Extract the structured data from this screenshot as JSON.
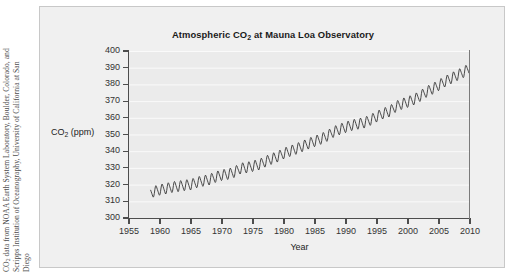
{
  "figure": {
    "background_color": "#ffffff",
    "panel_color": "#f0f0f0",
    "plot_color": "#ebebeb",
    "gridline_color": "#fafafa",
    "line_color": "#2b2b2b"
  },
  "credit": {
    "line1": "CO",
    "line1_sub": "2",
    "line1_rest": " data from NOAA Earth System Laboratory, Boulder, Colorado, and",
    "line2": "Scripps Institution of Oceanography, University of California at San",
    "line3": "Diego"
  },
  "chart_data": {
    "type": "line",
    "title": "Atmospheric CO",
    "title_sub": "2",
    "title_rest": " at Mauna Loa Observatory",
    "xlabel": "Year",
    "ylabel": "CO",
    "ylabel_sub": "2",
    "ylabel_rest": " (ppm)",
    "xlim": [
      1955,
      2010
    ],
    "ylim": [
      300,
      400
    ],
    "xticks": [
      1955,
      1960,
      1965,
      1970,
      1975,
      1980,
      1985,
      1990,
      1995,
      2000,
      2005,
      2010
    ],
    "yticks": [
      300,
      310,
      320,
      330,
      340,
      350,
      360,
      370,
      380,
      390,
      400
    ],
    "grid": "horizontal",
    "legend": "none",
    "seasonal_amplitude_ppm": 3.0,
    "series": [
      {
        "name": "Mauna Loa monthly mean CO2",
        "description": "Keeling Curve: annual-mean trend with seasonal sawtooth oscillation",
        "x": [
          1958.5,
          1959,
          1960,
          1961,
          1962,
          1963,
          1964,
          1965,
          1966,
          1967,
          1968,
          1969,
          1970,
          1971,
          1972,
          1973,
          1974,
          1975,
          1976,
          1977,
          1978,
          1979,
          1980,
          1981,
          1982,
          1983,
          1984,
          1985,
          1986,
          1987,
          1988,
          1989,
          1990,
          1991,
          1992,
          1993,
          1994,
          1995,
          1996,
          1997,
          1998,
          1999,
          2000,
          2001,
          2002,
          2003,
          2004,
          2005,
          2006,
          2007,
          2008,
          2009,
          2010
        ],
        "values": [
          315.0,
          315.8,
          316.9,
          317.6,
          318.5,
          319.0,
          319.6,
          320.0,
          321.4,
          322.2,
          323.0,
          324.6,
          325.7,
          326.3,
          327.5,
          329.7,
          330.2,
          331.1,
          332.0,
          333.8,
          335.4,
          336.8,
          338.7,
          340.1,
          341.4,
          343.0,
          344.6,
          346.0,
          347.4,
          349.2,
          351.6,
          353.1,
          354.4,
          355.6,
          356.4,
          357.1,
          358.8,
          360.8,
          362.6,
          363.8,
          366.6,
          368.3,
          369.5,
          371.0,
          373.1,
          375.6,
          377.4,
          379.6,
          381.8,
          383.7,
          385.6,
          387.4,
          389.8
        ]
      }
    ]
  }
}
